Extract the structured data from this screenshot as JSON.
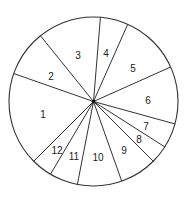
{
  "chart_data": {
    "type": "pie",
    "title": "",
    "categories": [
      "1",
      "2",
      "3",
      "4",
      "5",
      "6",
      "7",
      "8",
      "9",
      "10",
      "11",
      "12"
    ],
    "values": [
      17.9,
      8.8,
      12.1,
      5.3,
      11.7,
      11.0,
      4.8,
      3.5,
      7.1,
      8.5,
      5.4,
      4.0
    ],
    "value_units": "approx. percent of circle (unlabeled in figure)",
    "start_angle_deg_clockwise_from_top": 4.7,
    "order": "clockwise starting at slice 4: 4,5,6,7,8,9,10,11,12,1,2,3",
    "legend": "none",
    "labels_inside_slices": true
  },
  "geometry": {
    "cx": 93.5,
    "cy": 101.5,
    "r": 84.5,
    "boundaries_deg": [
      4.7,
      23.9,
      65.9,
      105.4,
      122.5,
      135.0,
      160.5,
      191.0,
      210.6,
      225.0,
      289.3,
      321.1
    ],
    "stroke": "#333333",
    "fill": "#ffffff"
  },
  "labels": [
    {
      "text": "1",
      "x": 43,
      "y": 118
    },
    {
      "text": "2",
      "x": 51,
      "y": 80
    },
    {
      "text": "3",
      "x": 78,
      "y": 59
    },
    {
      "text": "4",
      "x": 106,
      "y": 57
    },
    {
      "text": "5",
      "x": 133,
      "y": 72
    },
    {
      "text": "6",
      "x": 148,
      "y": 104
    },
    {
      "text": "7",
      "x": 146,
      "y": 130
    },
    {
      "text": "8",
      "x": 139,
      "y": 143
    },
    {
      "text": "9",
      "x": 124,
      "y": 154
    },
    {
      "text": "10",
      "x": 98,
      "y": 161
    },
    {
      "text": "11",
      "x": 74,
      "y": 160
    },
    {
      "text": "12",
      "x": 57,
      "y": 154
    }
  ]
}
